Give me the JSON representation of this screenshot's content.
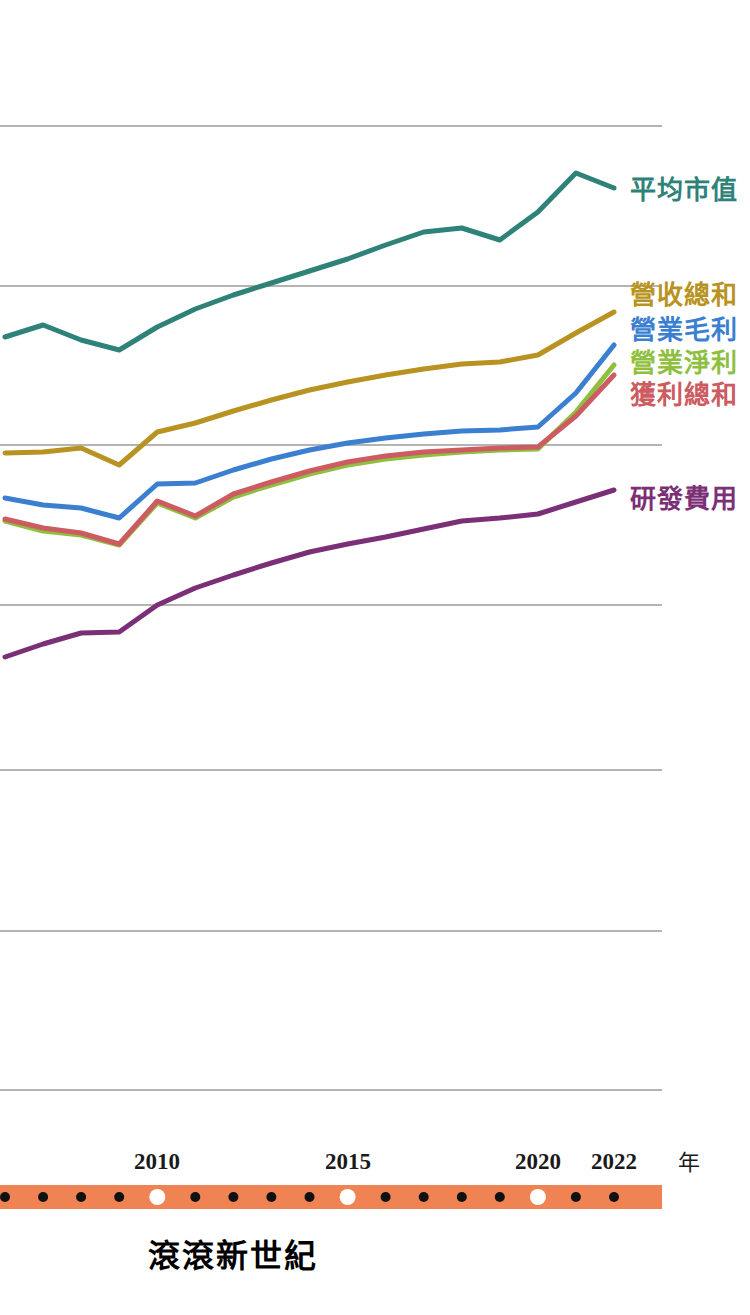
{
  "caption": {
    "text": "滾滾新世紀",
    "color": "#e8502a"
  },
  "axis": {
    "unit_label": "年",
    "ticks": [
      {
        "label": "2010",
        "x": 157
      },
      {
        "label": "2015",
        "x": 348
      },
      {
        "label": "2020",
        "x": 538
      },
      {
        "label": "2022",
        "x": 614
      }
    ],
    "band_color": "#ef8354",
    "dot_color": "#111111",
    "highlight_dot_color": "#ffffff",
    "dot_years": [
      2006,
      2007,
      2008,
      2009,
      2010,
      2011,
      2012,
      2013,
      2014,
      2015,
      2016,
      2017,
      2018,
      2019,
      2020,
      2021,
      2022
    ],
    "highlight_years": [
      2010,
      2015,
      2020
    ]
  },
  "gridlines": {
    "color": "#6a6a6a",
    "y": [
      126,
      286,
      445,
      605,
      770,
      931,
      1090
    ]
  },
  "legend": [
    {
      "name": "平均市值",
      "color": "#2e8278",
      "y": 178
    },
    {
      "name": "營收總和",
      "color": "#b89322",
      "y": 283
    },
    {
      "name": "營業毛利",
      "color": "#3a7fd0",
      "y": 318
    },
    {
      "name": "營業淨利",
      "color": "#8fbf3f",
      "y": 351
    },
    {
      "name": "獲利總和",
      "color": "#cc5b62",
      "y": 383
    },
    {
      "name": "研發費用",
      "color": "#7b2f76",
      "y": 487
    }
  ],
  "chart_data": {
    "type": "line",
    "title": "滾滾新世紀",
    "xlabel": "年",
    "ylabel": "",
    "grid": true,
    "legend_position": "right",
    "x": [
      2006,
      2007,
      2008,
      2009,
      2010,
      2011,
      2012,
      2013,
      2014,
      2015,
      2016,
      2017,
      2018,
      2019,
      2020,
      2021,
      2022
    ],
    "xlim": [
      2006,
      2022
    ],
    "series": [
      {
        "name": "平均市值",
        "color": "#2e8278",
        "values_px_y": [
          337,
          325,
          340,
          350,
          327,
          309,
          295,
          283,
          271,
          259,
          245,
          232,
          228,
          240,
          212,
          173,
          188
        ]
      },
      {
        "name": "營收總和",
        "color": "#b89322",
        "values_px_y": [
          453,
          452,
          448,
          465,
          432,
          423,
          411,
          400,
          390,
          382,
          375,
          369,
          364,
          362,
          355,
          333,
          312
        ]
      },
      {
        "name": "營業毛利",
        "color": "#3a7fd0",
        "values_px_y": [
          498,
          505,
          508,
          518,
          484,
          483,
          470,
          459,
          450,
          443,
          438,
          434,
          431,
          430,
          427,
          393,
          345
        ]
      },
      {
        "name": "營業淨利",
        "color": "#8fbf3f",
        "values_px_y": [
          521,
          531,
          535,
          545,
          503,
          518,
          497,
          485,
          474,
          465,
          459,
          455,
          452,
          450,
          449,
          412,
          365
        ]
      },
      {
        "name": "獲利總和",
        "color": "#cc5b62",
        "values_px_y": [
          519,
          528,
          533,
          544,
          501,
          516,
          494,
          482,
          471,
          462,
          456,
          452,
          450,
          448,
          447,
          416,
          375
        ]
      },
      {
        "name": "研發費用",
        "color": "#7b2f76",
        "values_px_y": [
          657,
          644,
          633,
          632,
          605,
          588,
          575,
          563,
          552,
          544,
          537,
          529,
          521,
          518,
          514,
          502,
          490
        ]
      }
    ]
  }
}
